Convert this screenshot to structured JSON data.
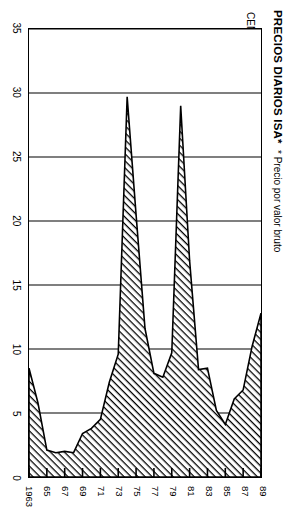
{
  "figure": {
    "title": "PRECIOS DIARIOS ISA*",
    "footnote": "* Precio por valor bruto",
    "value_axis_title": "CENTAVOS LIBRA"
  },
  "chart_data": {
    "type": "area",
    "title": "PRECIOS DIARIOS ISA*",
    "subtitle": "* Precio por valor bruto",
    "xlabel": "",
    "ylabel": "CENTAVOS LIBRA",
    "orientation": "rotated-90",
    "grid": true,
    "legend": "none",
    "xlim": [
      1963,
      1989
    ],
    "ylim": [
      0,
      35
    ],
    "ytick_labels": [
      "35",
      "30",
      "25",
      "20",
      "15",
      "10",
      "5",
      "0"
    ],
    "yticks": [
      35,
      30,
      25,
      20,
      15,
      10,
      5,
      0
    ],
    "xtick_labels": [
      "1963",
      "65",
      "67",
      "69",
      "71",
      "73",
      "75",
      "77",
      "79",
      "81",
      "83",
      "85",
      "87",
      "89"
    ],
    "xticks": [
      1963,
      1965,
      1967,
      1969,
      1971,
      1973,
      1975,
      1977,
      1979,
      1981,
      1983,
      1985,
      1987,
      1989
    ],
    "series": [
      {
        "name": "Precio diario ISA (centavos por libra)",
        "x": [
          1963,
          1964,
          1965,
          1966,
          1967,
          1968,
          1969,
          1970,
          1971,
          1972,
          1973,
          1974,
          1975,
          1976,
          1977,
          1978,
          1979,
          1980,
          1981,
          1982,
          1983,
          1984,
          1985,
          1986,
          1987,
          1988,
          1989
        ],
        "values": [
          8.5,
          5.8,
          2.1,
          1.9,
          2.0,
          1.9,
          3.4,
          3.8,
          4.5,
          7.4,
          9.6,
          29.7,
          20.5,
          11.6,
          8.1,
          7.8,
          9.7,
          29.0,
          16.9,
          8.4,
          8.5,
          5.2,
          4.1,
          6.1,
          6.8,
          10.2,
          12.8
        ]
      }
    ],
    "annotations": [
      {
        "label": "pico 1974",
        "x": 1974,
        "y": 29.7
      },
      {
        "label": "pico 1980",
        "x": 1980,
        "y": 29.0
      },
      {
        "label": "minimo 1985",
        "x": 1985,
        "y": 4.1
      }
    ],
    "fill_pattern": "diagonal-hatch",
    "fill_color": "#000000"
  }
}
